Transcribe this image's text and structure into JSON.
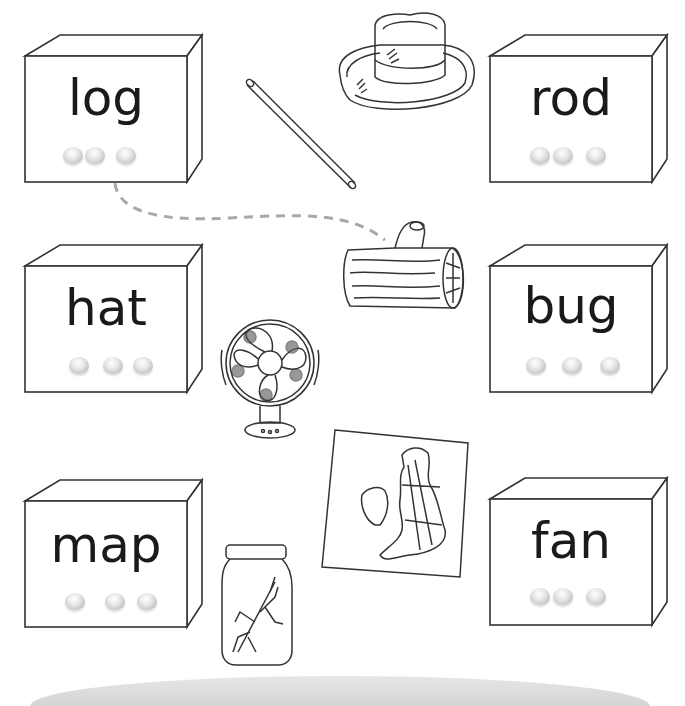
{
  "worksheet": {
    "activity": "Match each word box to its picture by drawing a line",
    "example_match": {
      "from": "log",
      "to": "log-picture",
      "line_style": "dashed",
      "line_color": "#a8a8a8"
    }
  },
  "word_boxes": [
    {
      "id": "log",
      "word": "log",
      "sound_buttons": 3,
      "dot_pattern": "2+1"
    },
    {
      "id": "hat",
      "word": "hat",
      "sound_buttons": 3,
      "dot_pattern": "1+1+1"
    },
    {
      "id": "map",
      "word": "map",
      "sound_buttons": 3,
      "dot_pattern": "1+1+1"
    },
    {
      "id": "rod",
      "word": "rod",
      "sound_buttons": 3,
      "dot_pattern": "2+1"
    },
    {
      "id": "bug",
      "word": "bug",
      "sound_buttons": 3,
      "dot_pattern": "1+1+1"
    },
    {
      "id": "fan",
      "word": "fan",
      "sound_buttons": 3,
      "dot_pattern": "2+1"
    }
  ],
  "pictures": [
    {
      "id": "rod-picture",
      "depicts": "rod"
    },
    {
      "id": "hat-picture",
      "depicts": "hat"
    },
    {
      "id": "log-picture",
      "depicts": "log"
    },
    {
      "id": "fan-picture",
      "depicts": "fan"
    },
    {
      "id": "map-picture",
      "depicts": "map"
    },
    {
      "id": "bug-picture",
      "depicts": "bug in jar"
    }
  ],
  "colors": {
    "ink": "#1a1a1a",
    "outline": "#333333",
    "dashed_line": "#a8a8a8",
    "floor": "#d9d9d9"
  }
}
